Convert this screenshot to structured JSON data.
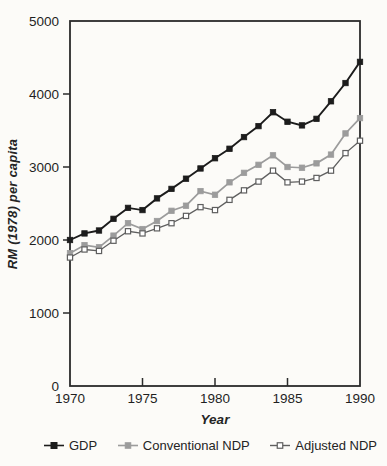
{
  "figure": {
    "background_color": "#fcfbf8",
    "frame_color": "#2b2b2b",
    "tick_label_color": "#1f1f1f"
  },
  "chart_data": {
    "type": "line",
    "title": "",
    "xlabel": "Year",
    "ylabel": "RM (1978) per capita",
    "xlim": [
      1970,
      1990
    ],
    "ylim": [
      0,
      5000
    ],
    "x_ticks": [
      1970,
      1975,
      1980,
      1985,
      1990
    ],
    "inner_x_ticks": [
      1975,
      1980,
      1985
    ],
    "y_ticks": [
      0,
      1000,
      2000,
      3000,
      4000,
      5000
    ],
    "grid": false,
    "legend_position": "bottom",
    "x": [
      1970,
      1971,
      1972,
      1973,
      1974,
      1975,
      1976,
      1977,
      1978,
      1979,
      1980,
      1981,
      1982,
      1983,
      1984,
      1985,
      1986,
      1987,
      1988,
      1989,
      1990
    ],
    "series": [
      {
        "name": "GDP",
        "color": "#1c1c1c",
        "marker": "filled-square",
        "marker_fill": "#1c1c1c",
        "line_width": 1.9,
        "values": [
          2000,
          2090,
          2130,
          2290,
          2440,
          2410,
          2570,
          2700,
          2840,
          2980,
          3120,
          3250,
          3410,
          3560,
          3750,
          3620,
          3570,
          3660,
          3900,
          4150,
          4440
        ]
      },
      {
        "name": "Conventional NDP",
        "color": "#9c9c9c",
        "marker": "filled-square",
        "marker_fill": "#9c9c9c",
        "line_width": 1.7,
        "values": [
          1820,
          1930,
          1900,
          2060,
          2230,
          2150,
          2260,
          2400,
          2470,
          2670,
          2620,
          2790,
          2920,
          3030,
          3160,
          3000,
          2990,
          3050,
          3170,
          3460,
          3670
        ]
      },
      {
        "name": "Adjusted NDP",
        "color": "#5f5f5f",
        "marker": "open-square",
        "marker_fill": "#ffffff",
        "line_width": 1.3,
        "values": [
          1760,
          1870,
          1850,
          1990,
          2120,
          2090,
          2160,
          2230,
          2330,
          2450,
          2410,
          2550,
          2680,
          2800,
          2950,
          2790,
          2800,
          2850,
          2950,
          3190,
          3360
        ]
      }
    ]
  }
}
